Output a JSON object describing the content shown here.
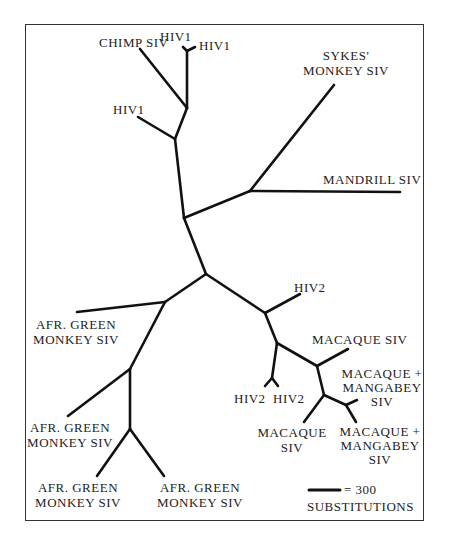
{
  "diagram": {
    "type": "unrooted phylogenetic tree",
    "labels": {
      "chimp_siv": "CHIMP SIV",
      "hiv1_a": "HIV1",
      "hiv1_b": "HIV1",
      "hiv1_c": "HIV1",
      "sykes_1": "SYKES'",
      "sykes_2": "MONKEY SIV",
      "mandrill": "MANDRILL SIV",
      "hiv2_top": "HIV2",
      "macaque_siv_top": "MACAQUE SIV",
      "mm1_1": "MACAQUE +",
      "mm1_2": "MANGABEY",
      "mm1_3": "SIV",
      "hiv2_left": "HIV2",
      "hiv2_right": "HIV2",
      "macaque_siv_bottom_1": "MACAQUE",
      "macaque_siv_bottom_2": "SIV",
      "mm2_1": "MACAQUE +",
      "mm2_2": "MANGABEY",
      "mm2_3": "SIV",
      "agm1_1": "AFR. GREEN",
      "agm1_2": "MONKEY SIV",
      "agm2_1": "AFR. GREEN",
      "agm2_2": "MONKEY SIV",
      "agm3_1": "AFR. GREEN",
      "agm3_2": "MONKEY SIV",
      "agm4_1": "AFR. GREEN",
      "agm4_2": "MONKEY SIV"
    },
    "scale_bar": {
      "value": "= 300",
      "unit": "SUBSTITUTIONS"
    },
    "colors": {
      "branch": "#111111",
      "frame": "#333333",
      "text": "#222222"
    }
  }
}
